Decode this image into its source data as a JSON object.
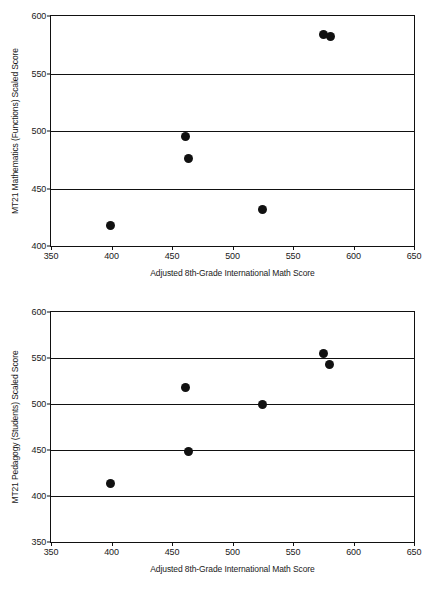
{
  "chart_data": [
    {
      "type": "scatter",
      "title": "",
      "xlabel": "Adjusted 8th-Grade International Math Score",
      "ylabel": "MT21 Mathematics (Functions) Scaled Score",
      "xlim": [
        350,
        650
      ],
      "ylim": [
        400,
        600
      ],
      "xticks": [
        350,
        400,
        450,
        500,
        550,
        600,
        650
      ],
      "yticks": [
        400,
        450,
        500,
        550,
        600
      ],
      "grid": "horizontal",
      "legend": "none",
      "marker_color": "#111111",
      "points": [
        {
          "x": 399,
          "y": 418
        },
        {
          "x": 461,
          "y": 495
        },
        {
          "x": 464,
          "y": 476
        },
        {
          "x": 525,
          "y": 432
        },
        {
          "x": 575,
          "y": 584
        },
        {
          "x": 581,
          "y": 582
        }
      ]
    },
    {
      "type": "scatter",
      "title": "",
      "xlabel": "Adjusted 8th-Grade International Math Score",
      "ylabel": "MT21 Pedagogy (Students) Scaled Score",
      "xlim": [
        350,
        650
      ],
      "ylim": [
        350,
        600
      ],
      "xticks": [
        350,
        400,
        450,
        500,
        550,
        600,
        650
      ],
      "yticks": [
        350,
        400,
        450,
        500,
        550,
        600
      ],
      "grid": "horizontal",
      "legend": "none",
      "marker_color": "#111111",
      "points": [
        {
          "x": 399,
          "y": 414
        },
        {
          "x": 461,
          "y": 518
        },
        {
          "x": 464,
          "y": 448
        },
        {
          "x": 525,
          "y": 499
        },
        {
          "x": 575,
          "y": 555
        },
        {
          "x": 580,
          "y": 543
        }
      ]
    }
  ]
}
